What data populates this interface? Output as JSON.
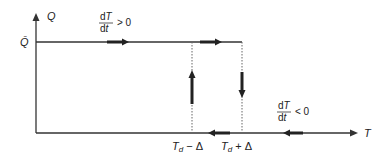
{
  "diagram": {
    "type": "hysteresis-relay",
    "axes": {
      "y_label": "Q",
      "x_label": "T",
      "y_level_label": "Q̄"
    },
    "thresholds": {
      "lower": {
        "base": "T",
        "sub": "d",
        "suffix": " − Δ"
      },
      "upper": {
        "base": "T",
        "sub": "d",
        "suffix": " + Δ"
      }
    },
    "annotations": {
      "rising": {
        "num": "dT",
        "den": "dt",
        "rel": "> 0"
      },
      "falling": {
        "num": "dT",
        "den": "dt",
        "rel": "< 0"
      }
    },
    "colors": {
      "line": "#333333",
      "dotted": "#666666",
      "background": "#ffffff"
    }
  }
}
